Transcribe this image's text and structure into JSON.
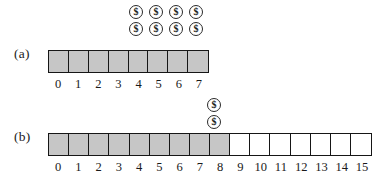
{
  "figure": {
    "background_color": "#ffffff",
    "filled_cell_color": "#c6c6c6",
    "empty_cell_color": "#ffffff",
    "border_color": "#161616",
    "coin_glyph": "$"
  },
  "panels": [
    {
      "id": "a",
      "label": "(a)",
      "table": {
        "capacity": 8,
        "num_items": 8,
        "cells": [
          {
            "index": 0,
            "label": "0",
            "filled": true
          },
          {
            "index": 1,
            "label": "1",
            "filled": true
          },
          {
            "index": 2,
            "label": "2",
            "filled": true
          },
          {
            "index": 3,
            "label": "3",
            "filled": true
          },
          {
            "index": 4,
            "label": "4",
            "filled": true
          },
          {
            "index": 5,
            "label": "5",
            "filled": true
          },
          {
            "index": 6,
            "label": "6",
            "filled": true
          },
          {
            "index": 7,
            "label": "7",
            "filled": true
          }
        ]
      },
      "coins": {
        "total": 8,
        "rows": 2,
        "columns": 4,
        "over_cell_indices": [
          4,
          5,
          6,
          7
        ],
        "glyph": "$",
        "stacks": [
          {
            "over_cell": 4,
            "count": 2
          },
          {
            "over_cell": 5,
            "count": 2
          },
          {
            "over_cell": 6,
            "count": 2
          },
          {
            "over_cell": 7,
            "count": 2
          }
        ]
      }
    },
    {
      "id": "b",
      "label": "(b)",
      "table": {
        "capacity": 16,
        "num_items": 9,
        "cells": [
          {
            "index": 0,
            "label": "0",
            "filled": true
          },
          {
            "index": 1,
            "label": "1",
            "filled": true
          },
          {
            "index": 2,
            "label": "2",
            "filled": true
          },
          {
            "index": 3,
            "label": "3",
            "filled": true
          },
          {
            "index": 4,
            "label": "4",
            "filled": true
          },
          {
            "index": 5,
            "label": "5",
            "filled": true
          },
          {
            "index": 6,
            "label": "6",
            "filled": true
          },
          {
            "index": 7,
            "label": "7",
            "filled": true
          },
          {
            "index": 8,
            "label": "8",
            "filled": true
          },
          {
            "index": 9,
            "label": "9",
            "filled": false
          },
          {
            "index": 10,
            "label": "10",
            "filled": false
          },
          {
            "index": 11,
            "label": "11",
            "filled": false
          },
          {
            "index": 12,
            "label": "12",
            "filled": false
          },
          {
            "index": 13,
            "label": "13",
            "filled": false
          },
          {
            "index": 14,
            "label": "14",
            "filled": false
          },
          {
            "index": 15,
            "label": "15",
            "filled": false
          }
        ]
      },
      "coins": {
        "total": 2,
        "rows": 2,
        "columns": 1,
        "over_cell_indices": [
          8
        ],
        "glyph": "$",
        "stacks": [
          {
            "over_cell": 8,
            "count": 2
          }
        ]
      }
    }
  ]
}
